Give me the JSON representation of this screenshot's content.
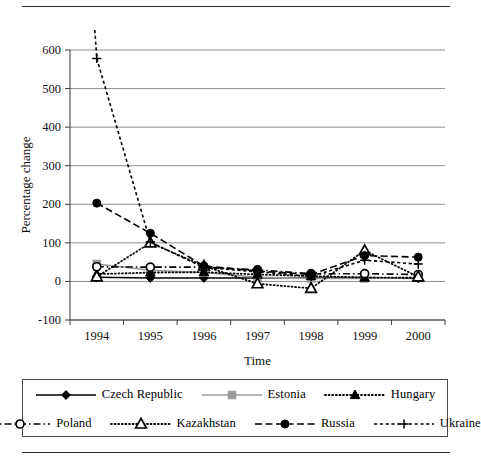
{
  "figure": {
    "top_rule": "",
    "bottom_rule": ""
  },
  "chart_data": {
    "type": "line",
    "title": "",
    "xlabel": "Time",
    "ylabel": "Percentage change",
    "categories": [
      "1994",
      "1995",
      "1996",
      "1997",
      "1998",
      "1999",
      "2000"
    ],
    "x": [
      1994,
      1995,
      1996,
      1997,
      1998,
      1999,
      2000
    ],
    "xlim": [
      1993.5,
      2000.5
    ],
    "ylim": [
      -100,
      600
    ],
    "yticks": [
      -100,
      0,
      100,
      200,
      300,
      400,
      500,
      600
    ],
    "ytick_labels": [
      "-100",
      "0",
      "100",
      "200",
      "300",
      "400",
      "500",
      "600"
    ],
    "grid": "horizontal",
    "legend_position": "bottom",
    "series": [
      {
        "name": "Czech Republic",
        "marker": "filled-diamond",
        "line_style": "solid",
        "color": "#000000",
        "values": [
          10,
          9,
          9,
          9,
          10,
          10,
          8
        ]
      },
      {
        "name": "Estonia",
        "marker": "filled-square",
        "line_style": "solid",
        "color": "#9a9a9a",
        "values": [
          45,
          29,
          23,
          11,
          8,
          8,
          10
        ]
      },
      {
        "name": "Hungary",
        "marker": "filled-triangle",
        "line_style": "dotted",
        "color": "#000000",
        "values": [
          19,
          23,
          24,
          18,
          14,
          10,
          10
        ]
      },
      {
        "name": "Poland",
        "marker": "open-circle",
        "line_style": "dash-dot",
        "color": "#000000",
        "values": [
          33,
          28,
          20,
          15,
          12,
          7,
          10
        ]
      },
      {
        "name": "Kazakhstan",
        "marker": "open-triangle",
        "line_style": "dotted",
        "color": "#000000",
        "values": [
          1872,
          176,
          39,
          17,
          -2,
          18,
          13
        ]
      },
      {
        "name": "Russia",
        "marker": "filled-circle",
        "line_style": "dashed",
        "color": "#000000",
        "values": [
          203,
          131,
          48,
          15,
          28,
          86,
          21
        ]
      },
      {
        "name": "Ukraine",
        "marker": "plus",
        "line_style": "dashed-fine",
        "color": "#000000",
        "values": [
          891,
          377,
          80,
          16,
          11,
          22,
          28
        ]
      }
    ],
    "plotted_points": {
      "note": "pixel-read values as drawn inside the visible -100..600 window",
      "Czech Republic": [
        11,
        9,
        9,
        9,
        10,
        10,
        8
      ],
      "Estonia": [
        45,
        29,
        23,
        11,
        8,
        8,
        10
      ],
      "Hungary": [
        19,
        23,
        24,
        18,
        14,
        10,
        10
      ],
      "Poland": [
        38,
        37,
        37,
        30,
        20,
        20,
        18
      ],
      "Kazakhstan": [
        12,
        100,
        40,
        -6,
        -18,
        80,
        12
      ],
      "Russia": [
        203,
        125,
        40,
        27,
        18,
        67,
        63
      ],
      "Ukraine": [
        578,
        102,
        36,
        25,
        13,
        55,
        45
      ]
    }
  },
  "legend": {
    "rows": [
      [
        {
          "label": "Czech Republic",
          "marker": "filled-diamond",
          "line_style": "solid",
          "color": "#000000"
        },
        {
          "label": "Estonia",
          "marker": "filled-square",
          "line_style": "solid",
          "color": "#9a9a9a"
        },
        {
          "label": "Hungary",
          "marker": "filled-triangle",
          "line_style": "dotted",
          "color": "#000000"
        }
      ],
      [
        {
          "label": "Poland",
          "marker": "open-circle",
          "line_style": "dash-dot",
          "color": "#000000"
        },
        {
          "label": "Kazakhstan",
          "marker": "open-triangle",
          "line_style": "dotted",
          "color": "#000000"
        },
        {
          "label": "Russia",
          "marker": "filled-circle",
          "line_style": "dashed",
          "color": "#000000"
        },
        {
          "label": "Ukraine",
          "marker": "plus",
          "line_style": "dashed-fine",
          "color": "#000000"
        }
      ]
    ]
  }
}
